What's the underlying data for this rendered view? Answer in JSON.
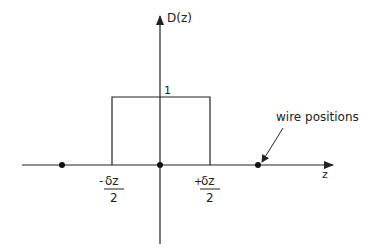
{
  "diagram": {
    "y_axis_label": "D(z)",
    "x_axis_label": "z",
    "box_height_label": "1",
    "left_edge": {
      "sign": "-",
      "numerator": "δz",
      "denominator": "2"
    },
    "right_edge": {
      "sign": "+",
      "numerator": "δz",
      "denominator": "2"
    },
    "annotation": "wire positions",
    "wire_positions": [
      -1,
      0,
      1
    ],
    "box": {
      "from": -0.5,
      "to": 0.5,
      "value": 1
    },
    "line_color": "#222222"
  }
}
